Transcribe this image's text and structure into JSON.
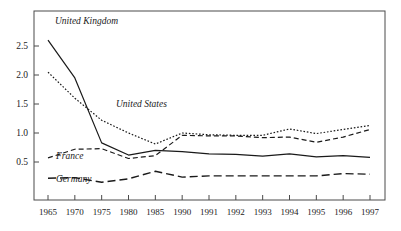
{
  "chart_data": {
    "type": "line",
    "title": "",
    "xlabel": "",
    "ylabel": "",
    "categories": [
      "1965",
      "1970",
      "1975",
      "1980",
      "1985",
      "1990",
      "1991",
      "1992",
      "1993",
      "1994",
      "1995",
      "1996",
      "1997"
    ],
    "ylim": [
      0.0,
      2.75
    ],
    "yticks": [
      0.5,
      1.0,
      1.5,
      2.0,
      2.5
    ],
    "ytick_labels": [
      "0.5",
      "1.0",
      "1.5",
      "2.0",
      "2.5"
    ],
    "grid": false,
    "legend": "inline-annotations",
    "series": [
      {
        "name": "United Kingdom",
        "style": "solid",
        "values": [
          2.6,
          1.95,
          0.83,
          0.62,
          0.7,
          0.68,
          0.64,
          0.63,
          0.6,
          0.64,
          0.59,
          0.61,
          0.58
        ]
      },
      {
        "name": "United States",
        "style": "dotted",
        "values": [
          2.05,
          1.6,
          1.22,
          1.0,
          0.81,
          1.0,
          0.97,
          0.96,
          0.96,
          1.07,
          0.99,
          1.06,
          1.13
        ]
      },
      {
        "name": "France",
        "style": "dashed",
        "values": [
          0.57,
          0.72,
          0.73,
          0.56,
          0.61,
          0.96,
          0.95,
          0.95,
          0.92,
          0.93,
          0.84,
          0.93,
          1.06
        ]
      },
      {
        "name": "Germany",
        "style": "long-dash",
        "values": [
          0.22,
          0.23,
          0.15,
          0.21,
          0.34,
          0.24,
          0.26,
          0.26,
          0.26,
          0.26,
          0.26,
          0.3,
          0.29
        ]
      }
    ],
    "annotations": [
      {
        "text": "United Kingdom",
        "x": 55,
        "y": 24
      },
      {
        "text": "United States",
        "x": 116,
        "y": 107
      },
      {
        "text": "France",
        "x": 56,
        "y": 159
      },
      {
        "text": "Germany",
        "x": 56,
        "y": 182
      }
    ],
    "colors": {
      "line": "#1a1a1a",
      "axis": "#4a4a4a",
      "background": "#ffffff"
    }
  }
}
